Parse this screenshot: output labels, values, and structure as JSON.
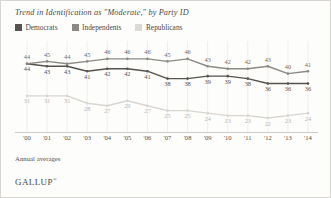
{
  "chart_data": {
    "type": "line",
    "title": "Trend in Identification as \"Moderate,\" by Party ID",
    "xlabel": "",
    "ylabel": "",
    "ylim": [
      20,
      50
    ],
    "grid": "vertical",
    "legend_position": "top-left",
    "categories": [
      "'00",
      "'01",
      "'02",
      "'03",
      "'04",
      "'05",
      "'06",
      "'07",
      "'08",
      "'09",
      "'10",
      "'11",
      "'12",
      "'13",
      "'14"
    ],
    "series": [
      {
        "name": "Democrats",
        "color": "#57534e",
        "values": [
          44,
          43,
          43,
          41,
          42,
          42,
          41,
          38,
          38,
          39,
          39,
          38,
          36,
          36,
          36
        ]
      },
      {
        "name": "Independents",
        "color": "#8d8a85",
        "values": [
          44,
          45,
          44,
          45,
          46,
          46,
          46,
          45,
          46,
          43,
          42,
          42,
          43,
          40,
          41
        ]
      },
      {
        "name": "Republicans",
        "color": "#d9d6d1",
        "values": [
          31,
          31,
          31,
          28,
          27,
          29,
          27,
          25,
          25,
          24,
          23,
          23,
          22,
          23,
          24
        ]
      }
    ],
    "note": "Annual averages",
    "brand": "GALLUP",
    "brand_mark": "®"
  },
  "legend": {
    "items": [
      {
        "label": "Democrats",
        "color": "#57534e"
      },
      {
        "label": "Independents",
        "color": "#8d8a85"
      },
      {
        "label": "Republicans",
        "color": "#dcd9d4"
      }
    ]
  }
}
